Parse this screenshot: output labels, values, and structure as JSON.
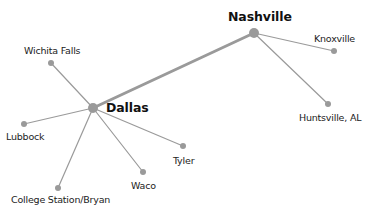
{
  "diagram": {
    "type": "network",
    "colors": {
      "edge": "#9a9a9a",
      "node": "#9a9a9a",
      "text": "#222222",
      "background": "#ffffff"
    },
    "nodes": [
      {
        "id": "dallas",
        "label": "Dallas",
        "hub": true,
        "x": 93,
        "y": 108,
        "r": 5
      },
      {
        "id": "nashville",
        "label": "Nashville",
        "hub": true,
        "x": 254,
        "y": 33,
        "r": 5
      },
      {
        "id": "wichita_falls",
        "label": "Wichita Falls",
        "hub": false,
        "x": 51,
        "y": 63,
        "r": 3
      },
      {
        "id": "lubbock",
        "label": "Lubbock",
        "hub": false,
        "x": 24,
        "y": 124,
        "r": 3
      },
      {
        "id": "college_station",
        "label": "College Station/Bryan",
        "hub": false,
        "x": 58,
        "y": 188,
        "r": 3
      },
      {
        "id": "waco",
        "label": "Waco",
        "hub": false,
        "x": 143,
        "y": 172,
        "r": 3
      },
      {
        "id": "tyler",
        "label": "Tyler",
        "hub": false,
        "x": 183,
        "y": 146,
        "r": 3
      },
      {
        "id": "knoxville",
        "label": "Knoxville",
        "hub": false,
        "x": 334,
        "y": 51,
        "r": 3
      },
      {
        "id": "huntsville",
        "label": "Huntsville, AL",
        "hub": false,
        "x": 328,
        "y": 104,
        "r": 3
      }
    ],
    "edges": [
      {
        "from": "dallas",
        "to": "nashville",
        "weight": 3
      },
      {
        "from": "dallas",
        "to": "wichita_falls",
        "weight": 1.2
      },
      {
        "from": "dallas",
        "to": "lubbock",
        "weight": 1.2
      },
      {
        "from": "dallas",
        "to": "college_station",
        "weight": 1.2
      },
      {
        "from": "dallas",
        "to": "waco",
        "weight": 1.2
      },
      {
        "from": "dallas",
        "to": "tyler",
        "weight": 1.2
      },
      {
        "from": "nashville",
        "to": "knoxville",
        "weight": 1.2
      },
      {
        "from": "nashville",
        "to": "huntsville",
        "weight": 1.2
      }
    ],
    "labels": {
      "dallas": "Dallas",
      "nashville": "Nashville",
      "wichita_falls": "Wichita Falls",
      "lubbock": "Lubbock",
      "college_station": "College Station/Bryan",
      "waco": "Waco",
      "tyler": "Tyler",
      "knoxville": "Knoxville",
      "huntsville": "Huntsville, AL"
    }
  }
}
